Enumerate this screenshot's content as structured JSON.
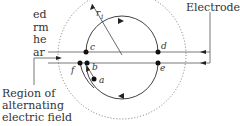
{
  "side_text": [
    "ed",
    "rm",
    "he",
    "ar"
  ],
  "labels": {
    "electrodes": "Electrodes",
    "region": [
      "Region of",
      "alternating",
      "electric field"
    ],
    "r1": "r",
    "r1_sub": "1",
    "c": "c",
    "d": "d",
    "e": "e",
    "f": "f",
    "b": "b",
    "a": "a"
  }
}
